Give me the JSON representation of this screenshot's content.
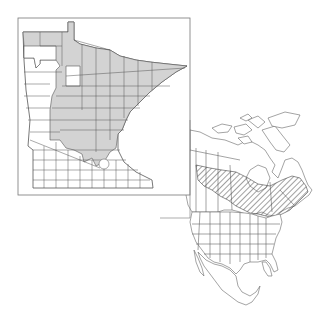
{
  "figure": {
    "type": "species-distribution-map",
    "panels": [
      {
        "id": "minnesota",
        "description": "Minnesota county map; shaded counties indicate occurrence",
        "fill_color": "#d3d3d3",
        "shaded_region": "northern and central counties (Arrowhead, north-central, east-central down to Twin Cities area)"
      },
      {
        "id": "north-america",
        "description": "North America map with states/provinces; hatched area indicates range",
        "hatch_color": "#444444",
        "hatched_region": "boreal band across Canada from Alberta/Saskatchewan east to Quebec, Labrador and the Maritimes, dipping into the Great Lakes / northern New England"
      }
    ]
  },
  "colors": {
    "background": "#ffffff",
    "line": "#555555",
    "shaded": "#d3d3d3",
    "frame": "#777777"
  }
}
